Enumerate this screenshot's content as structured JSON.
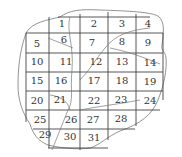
{
  "diagram": {
    "type": "grid-over-irregular-region",
    "grid": {
      "cols_x": [
        26,
        49,
        80,
        108,
        136,
        163
      ],
      "rows_y": [
        17,
        33,
        53,
        72,
        91,
        110,
        129,
        148
      ]
    },
    "cells": [
      {
        "label": "1",
        "x": 62,
        "y": 24
      },
      {
        "label": "2",
        "x": 94,
        "y": 24
      },
      {
        "label": "3",
        "x": 122,
        "y": 24
      },
      {
        "label": "4",
        "x": 148,
        "y": 24
      },
      {
        "label": "5",
        "x": 37,
        "y": 44
      },
      {
        "label": "6",
        "x": 64,
        "y": 40
      },
      {
        "label": "7",
        "x": 92,
        "y": 43
      },
      {
        "label": "8",
        "x": 122,
        "y": 42
      },
      {
        "label": "9",
        "x": 148,
        "y": 43
      },
      {
        "label": "10",
        "x": 37,
        "y": 62
      },
      {
        "label": "11",
        "x": 66,
        "y": 62
      },
      {
        "label": "12",
        "x": 96,
        "y": 62
      },
      {
        "label": "13",
        "x": 122,
        "y": 62
      },
      {
        "label": "14",
        "x": 150,
        "y": 63
      },
      {
        "label": "15",
        "x": 37,
        "y": 81
      },
      {
        "label": "16",
        "x": 61,
        "y": 81
      },
      {
        "label": "17",
        "x": 94,
        "y": 81
      },
      {
        "label": "18",
        "x": 122,
        "y": 81
      },
      {
        "label": "19",
        "x": 150,
        "y": 82
      },
      {
        "label": "20",
        "x": 37,
        "y": 101
      },
      {
        "label": "21",
        "x": 60,
        "y": 100
      },
      {
        "label": "22",
        "x": 94,
        "y": 101
      },
      {
        "label": "23",
        "x": 121,
        "y": 100
      },
      {
        "label": "24",
        "x": 150,
        "y": 101
      },
      {
        "label": "25",
        "x": 40,
        "y": 120
      },
      {
        "label": "26",
        "x": 71,
        "y": 120
      },
      {
        "label": "27",
        "x": 93,
        "y": 120
      },
      {
        "label": "28",
        "x": 121,
        "y": 119
      },
      {
        "label": "29",
        "x": 45,
        "y": 135
      },
      {
        "label": "30",
        "x": 70,
        "y": 137
      },
      {
        "label": "31",
        "x": 94,
        "y": 138
      }
    ]
  }
}
